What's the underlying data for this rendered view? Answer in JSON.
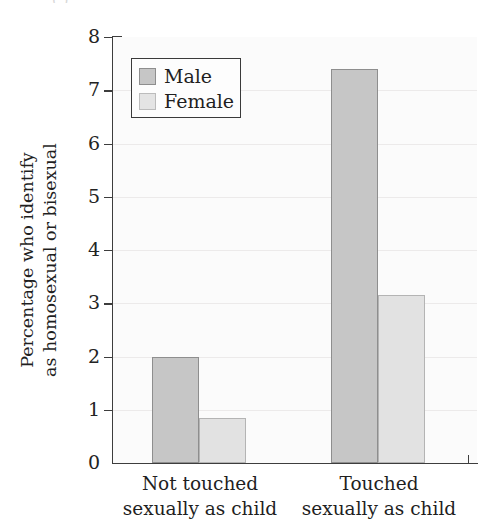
{
  "figure": {
    "cropped_top_text": "(                        )"
  },
  "legend": {
    "entries": [
      {
        "label": "Male",
        "color": "#c6c6c6"
      },
      {
        "label": "Female",
        "color": "#e2e2e2"
      }
    ]
  },
  "axes": {
    "ylabel_line1": "Percentage who identify",
    "ylabel_line2": "as homosexual or bisexual",
    "yticks": [
      "0",
      "1",
      "2",
      "3",
      "4",
      "5",
      "6",
      "7",
      "8"
    ],
    "xcategories": [
      {
        "line1": "Not touched",
        "line2": "sexually as child"
      },
      {
        "line1": "Touched",
        "line2": "sexually as child"
      }
    ]
  },
  "chart_data": {
    "type": "bar",
    "title": "",
    "xlabel": "",
    "ylabel": "Percentage who identify as homosexual or bisexual",
    "categories": [
      "Not touched sexually as child",
      "Touched sexually as child"
    ],
    "series": [
      {
        "name": "Male",
        "color": "#c6c6c6",
        "values": [
          2.0,
          7.4
        ]
      },
      {
        "name": "Female",
        "color": "#e2e2e2",
        "values": [
          0.85,
          3.15
        ]
      }
    ],
    "ylim": [
      0,
      8
    ],
    "ytick_step": 1,
    "grid": true,
    "grid_axis": "y",
    "legend_position": "upper left"
  }
}
